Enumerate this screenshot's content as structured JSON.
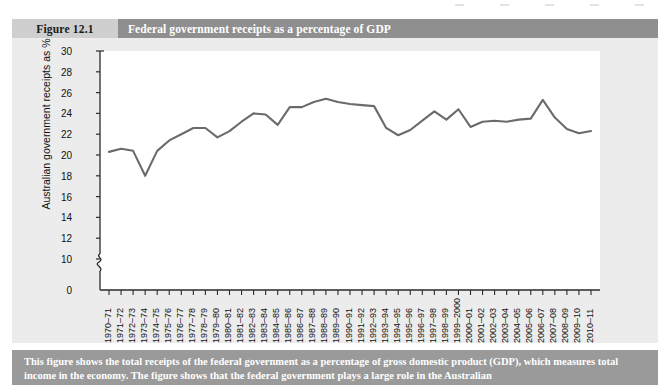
{
  "header": {
    "figure_number": "Figure 12.1",
    "title": "Federal government receipts as a percentage of GDP"
  },
  "caption": "This figure shows the total receipts of the federal government as a percentage of gross domestic product (GDP), which measures total income in the economy. The figure shows that the federal government plays a large role in the Australian",
  "colors": {
    "header_number_bg": "#cfcfcf",
    "header_title_bg": "#8f8f8f",
    "panel_bg": "#ececec",
    "plot_bg": "#ffffff",
    "line": "#6b6b6b",
    "caption_bg": "#9a9a9a",
    "axis": "#2b2b2b"
  },
  "chart_data": {
    "type": "line",
    "title": "Federal government receipts as a percentage of GDP",
    "xlabel": "",
    "ylabel": "Australian government receipts as %",
    "ylim": [
      0,
      30
    ],
    "y_ticks": [
      0,
      10,
      12,
      14,
      16,
      18,
      20,
      22,
      24,
      26,
      28,
      30
    ],
    "y_axis_break": true,
    "y_axis_break_between": [
      0,
      10
    ],
    "grid": false,
    "legend": "none",
    "categories": [
      "1970–71",
      "1971–72",
      "1972–73",
      "1973–74",
      "1974–75",
      "1975–76",
      "1976–77",
      "1977–78",
      "1978–79",
      "1979–80",
      "1980–81",
      "1981–82",
      "1982–83",
      "1983–84",
      "1984–85",
      "1985–86",
      "1986–87",
      "1987–88",
      "1988–89",
      "1989–90",
      "1990–91",
      "1991–92",
      "1992–93",
      "1993–94",
      "1994–95",
      "1995–96",
      "1996–97",
      "1997–98",
      "1998–99",
      "1999–2000",
      "2000–01",
      "2001–02",
      "2002–03",
      "2003–04",
      "2004–05",
      "2005–06",
      "2006–07",
      "2007–08",
      "2008–09",
      "2009–10",
      "2010–11"
    ],
    "values": [
      20.3,
      20.6,
      20.4,
      18.0,
      20.4,
      21.4,
      22.0,
      22.6,
      22.6,
      21.7,
      22.3,
      23.2,
      24.0,
      23.9,
      22.9,
      24.6,
      24.6,
      25.1,
      25.4,
      25.1,
      24.9,
      24.8,
      24.7,
      22.6,
      21.9,
      22.4,
      23.3,
      24.2,
      23.4,
      24.4,
      22.7,
      23.2,
      23.3,
      23.2,
      23.4,
      23.5,
      25.3,
      23.6,
      22.5,
      22.1,
      22.3
    ]
  }
}
